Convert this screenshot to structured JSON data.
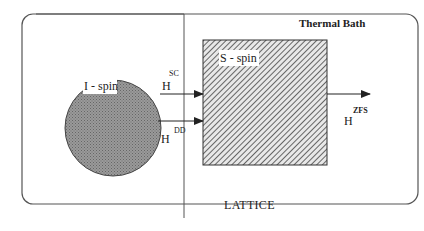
{
  "diagram": {
    "region_labels": {
      "thermal_bath": "Thermal Bath",
      "lattice": "LATTICE"
    },
    "nodes": {
      "i_spin": "I - spin",
      "s_spin": "S - spin"
    },
    "interactions": {
      "sc": {
        "base": "H",
        "sup": "SC"
      },
      "dd": {
        "base": "H",
        "sup": "DD"
      },
      "zfs": {
        "base": "H",
        "sup": "ZFS"
      }
    },
    "colors": {
      "border": "#555555",
      "circle_fill": "#8a8a8a",
      "hatch": "#444444",
      "text": "#222222"
    }
  }
}
